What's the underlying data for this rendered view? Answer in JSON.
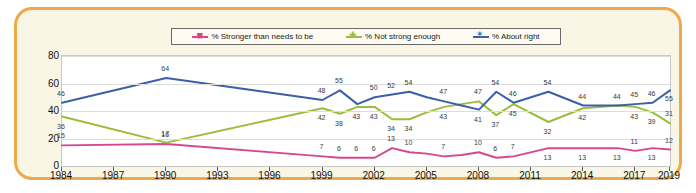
{
  "legend": {
    "items": [
      {
        "label": "% Stronger than needs to be",
        "color": "#d6478c",
        "marker": "square-dash"
      },
      {
        "label": "% Not strong enough",
        "color": "#9cbc3c",
        "marker": "plus"
      },
      {
        "label": "% About right",
        "color": "#3b5fa8",
        "marker": "star"
      }
    ]
  },
  "chart_data": {
    "type": "line",
    "title": "",
    "xlabel": "",
    "ylabel": "",
    "ylim": [
      0,
      80
    ],
    "yticks": [
      0,
      20,
      40,
      60,
      80
    ],
    "xticks": [
      "1984",
      "1987",
      "1990",
      "1993",
      "1996",
      "1999",
      "2002",
      "2005",
      "2008",
      "2011",
      "2014",
      "2017",
      "2019"
    ],
    "grid": true,
    "legend_position": "top",
    "x": [
      1984,
      1990,
      1999,
      2000,
      2001,
      2002,
      2003,
      2004,
      2005,
      2006,
      2007,
      2008,
      2009,
      2010,
      2012,
      2014,
      2016,
      2017,
      2018,
      2019
    ],
    "series": [
      {
        "name": "% Stronger than needs to be",
        "color": "#d6478c",
        "values": [
          15,
          16,
          7,
          6,
          6,
          6,
          13,
          10,
          9,
          7,
          8,
          10,
          6,
          7,
          13,
          13,
          13,
          11,
          13,
          12
        ],
        "labels": [
          "15",
          "16",
          "7",
          "6",
          "6",
          "6",
          "13",
          "10",
          "",
          "7",
          "",
          "10",
          "6",
          "7",
          "13",
          "13",
          "13",
          "11",
          "13",
          "12"
        ]
      },
      {
        "name": "% Not strong enough",
        "color": "#9cbc3c",
        "values": [
          36,
          17,
          42,
          38,
          43,
          43,
          34,
          34,
          39,
          43,
          45,
          47,
          37,
          45,
          32,
          42,
          44,
          43,
          39,
          31
        ],
        "labels": [
          "36",
          "17",
          "42",
          "38",
          "43",
          "43",
          "34",
          "34",
          "",
          "43",
          "",
          "47",
          "37",
          "45",
          "32",
          "42",
          "44",
          "43",
          "39",
          "31"
        ]
      },
      {
        "name": "% About right",
        "color": "#3b5fa8",
        "values": [
          46,
          64,
          48,
          55,
          45,
          50,
          52,
          54,
          50,
          47,
          44,
          41,
          54,
          46,
          54,
          44,
          44,
          45,
          46,
          55
        ],
        "labels": [
          "46",
          "64",
          "48",
          "55",
          "",
          "50",
          "52",
          "54",
          "",
          "47",
          "",
          "41",
          "54",
          "46",
          "54",
          "44",
          "",
          "45",
          "46",
          "55"
        ]
      }
    ],
    "point_label_overrides": {
      "series2_2008": "47",
      "series2_2007": ""
    }
  }
}
